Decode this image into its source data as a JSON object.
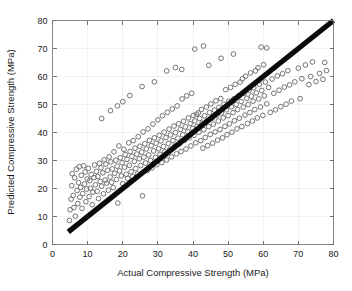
{
  "chart_data": {
    "type": "scatter",
    "title": "",
    "xlabel": "Actual Compressive Strength (MPa)",
    "ylabel": "Predicted Compressive Strength (MPa)",
    "xlim": [
      0,
      80
    ],
    "ylim": [
      0,
      80
    ],
    "xticks": [
      0,
      10,
      20,
      30,
      40,
      50,
      60,
      70,
      80
    ],
    "yticks": [
      0,
      10,
      20,
      30,
      40,
      50,
      60,
      70,
      80
    ],
    "xtick_labels": [
      "0",
      "10",
      "20",
      "30",
      "40",
      "50",
      "60",
      "70",
      "80"
    ],
    "ytick_labels": [
      "0",
      "10",
      "20",
      "30",
      "40",
      "50",
      "60",
      "70",
      "80"
    ],
    "grid": true,
    "legend": "none",
    "marker": "open-circle",
    "marker_color": "#6b6b6b",
    "reference_line": {
      "name": "identity-line",
      "type": "line",
      "x": [
        4.5,
        80
      ],
      "y": [
        4.5,
        80
      ],
      "color": "#0b0b0b",
      "width": 5.2
    },
    "series": [
      {
        "name": "Predicted vs Actual",
        "points": [
          [
            4.8,
            8.6
          ],
          [
            5.0,
            12.4
          ],
          [
            5.3,
            16.2
          ],
          [
            5.5,
            21.0
          ],
          [
            5.6,
            25.3
          ],
          [
            5.9,
            17.5
          ],
          [
            6.1,
            13.2
          ],
          [
            6.3,
            23.8
          ],
          [
            6.5,
            10.1
          ],
          [
            6.8,
            26.9
          ],
          [
            7.0,
            19.3
          ],
          [
            7.2,
            14.6
          ],
          [
            7.4,
            22.1
          ],
          [
            7.6,
            27.8
          ],
          [
            7.8,
            16.9
          ],
          [
            8.0,
            20.4
          ],
          [
            8.2,
            24.7
          ],
          [
            8.4,
            12.9
          ],
          [
            8.6,
            18.2
          ],
          [
            8.9,
            28.1
          ],
          [
            9.1,
            21.6
          ],
          [
            9.3,
            25.9
          ],
          [
            9.5,
            15.3
          ],
          [
            9.7,
            19.8
          ],
          [
            9.9,
            23.4
          ],
          [
            10.2,
            27.2
          ],
          [
            10.4,
            17.1
          ],
          [
            10.6,
            22.8
          ],
          [
            10.8,
            20.1
          ],
          [
            11.0,
            25.0
          ],
          [
            11.3,
            14.2
          ],
          [
            11.5,
            18.7
          ],
          [
            11.8,
            23.9
          ],
          [
            12.0,
            28.4
          ],
          [
            12.2,
            21.3
          ],
          [
            12.5,
            26.1
          ],
          [
            12.7,
            19.0
          ],
          [
            12.9,
            24.3
          ],
          [
            13.1,
            16.4
          ],
          [
            13.4,
            29.0
          ],
          [
            13.6,
            22.5
          ],
          [
            13.8,
            27.4
          ],
          [
            14.0,
            20.8
          ],
          [
            14.3,
            25.6
          ],
          [
            14.5,
            18.1
          ],
          [
            14.7,
            30.2
          ],
          [
            15.0,
            23.0
          ],
          [
            15.2,
            28.7
          ],
          [
            15.4,
            21.9
          ],
          [
            15.7,
            26.5
          ],
          [
            15.9,
            19.4
          ],
          [
            16.1,
            31.3
          ],
          [
            16.4,
            24.1
          ],
          [
            16.6,
            29.5
          ],
          [
            16.8,
            22.2
          ],
          [
            17.0,
            27.0
          ],
          [
            17.3,
            20.3
          ],
          [
            17.5,
            33.1
          ],
          [
            17.7,
            25.4
          ],
          [
            18.0,
            30.1
          ],
          [
            18.2,
            23.2
          ],
          [
            18.4,
            28.0
          ],
          [
            18.6,
            14.8
          ],
          [
            18.9,
            35.2
          ],
          [
            19.1,
            26.3
          ],
          [
            19.3,
            31.0
          ],
          [
            19.6,
            24.5
          ],
          [
            19.8,
            29.2
          ],
          [
            20.0,
            21.7
          ],
          [
            20.3,
            34.0
          ],
          [
            20.5,
            27.6
          ],
          [
            20.7,
            32.1
          ],
          [
            21.0,
            25.1
          ],
          [
            21.2,
            30.4
          ],
          [
            21.4,
            23.6
          ],
          [
            21.7,
            36.3
          ],
          [
            21.9,
            28.3
          ],
          [
            22.1,
            33.2
          ],
          [
            22.4,
            26.0
          ],
          [
            22.6,
            31.5
          ],
          [
            22.8,
            24.2
          ],
          [
            23.0,
            37.1
          ],
          [
            23.3,
            29.7
          ],
          [
            23.5,
            34.4
          ],
          [
            23.7,
            27.1
          ],
          [
            24.0,
            32.3
          ],
          [
            24.2,
            25.2
          ],
          [
            24.4,
            38.5
          ],
          [
            24.7,
            30.6
          ],
          [
            24.9,
            35.1
          ],
          [
            25.1,
            28.2
          ],
          [
            25.4,
            33.0
          ],
          [
            25.6,
            17.4
          ],
          [
            25.8,
            40.2
          ],
          [
            26.0,
            31.2
          ],
          [
            26.3,
            36.0
          ],
          [
            26.5,
            29.1
          ],
          [
            26.7,
            34.1
          ],
          [
            27.0,
            26.4
          ],
          [
            27.2,
            41.3
          ],
          [
            27.4,
            32.0
          ],
          [
            27.6,
            37.2
          ],
          [
            27.9,
            30.0
          ],
          [
            28.1,
            35.3
          ],
          [
            28.3,
            27.3
          ],
          [
            28.6,
            43.0
          ],
          [
            28.8,
            33.4
          ],
          [
            29.0,
            38.1
          ],
          [
            29.3,
            31.1
          ],
          [
            29.5,
            36.2
          ],
          [
            29.7,
            28.5
          ],
          [
            30.0,
            44.5
          ],
          [
            30.2,
            34.2
          ],
          [
            30.4,
            39.0
          ],
          [
            30.6,
            32.2
          ],
          [
            30.9,
            37.0
          ],
          [
            31.1,
            29.3
          ],
          [
            31.3,
            46.0
          ],
          [
            31.6,
            35.0
          ],
          [
            31.8,
            40.1
          ],
          [
            32.0,
            33.1
          ],
          [
            32.3,
            38.2
          ],
          [
            32.5,
            30.2
          ],
          [
            32.7,
            47.2
          ],
          [
            33.0,
            36.1
          ],
          [
            33.2,
            41.2
          ],
          [
            33.4,
            34.0
          ],
          [
            33.6,
            39.1
          ],
          [
            33.9,
            31.3
          ],
          [
            34.1,
            48.4
          ],
          [
            34.3,
            37.1
          ],
          [
            34.6,
            42.3
          ],
          [
            34.8,
            35.1
          ],
          [
            35.0,
            40.0
          ],
          [
            35.3,
            32.4
          ],
          [
            35.5,
            49.5
          ],
          [
            35.7,
            38.0
          ],
          [
            35.9,
            43.1
          ],
          [
            36.2,
            36.0
          ],
          [
            36.4,
            41.1
          ],
          [
            36.6,
            33.2
          ],
          [
            36.9,
            52.0
          ],
          [
            37.1,
            39.2
          ],
          [
            37.3,
            44.0
          ],
          [
            37.6,
            37.2
          ],
          [
            37.8,
            42.0
          ],
          [
            38.0,
            34.1
          ],
          [
            38.2,
            53.1
          ],
          [
            38.5,
            40.3
          ],
          [
            38.7,
            45.2
          ],
          [
            38.9,
            38.1
          ],
          [
            39.2,
            43.2
          ],
          [
            39.4,
            35.2
          ],
          [
            39.6,
            54.0
          ],
          [
            39.9,
            41.4
          ],
          [
            40.1,
            46.1
          ],
          [
            40.3,
            39.0
          ],
          [
            40.5,
            44.1
          ],
          [
            40.8,
            36.3
          ],
          [
            41.0,
            46.5
          ],
          [
            41.2,
            42.2
          ],
          [
            41.5,
            47.0
          ],
          [
            41.7,
            40.1
          ],
          [
            41.9,
            45.0
          ],
          [
            42.2,
            37.1
          ],
          [
            42.4,
            48.2
          ],
          [
            42.6,
            43.3
          ],
          [
            42.8,
            34.4
          ],
          [
            43.1,
            41.0
          ],
          [
            43.3,
            46.0
          ],
          [
            43.5,
            38.2
          ],
          [
            43.8,
            49.1
          ],
          [
            44.0,
            44.2
          ],
          [
            44.2,
            35.3
          ],
          [
            44.5,
            42.1
          ],
          [
            44.7,
            47.1
          ],
          [
            44.9,
            39.3
          ],
          [
            45.1,
            50.2
          ],
          [
            45.4,
            45.1
          ],
          [
            45.6,
            36.2
          ],
          [
            45.8,
            43.0
          ],
          [
            46.1,
            48.0
          ],
          [
            46.3,
            40.2
          ],
          [
            46.5,
            51.3
          ],
          [
            46.8,
            46.2
          ],
          [
            47.0,
            37.3
          ],
          [
            47.2,
            44.1
          ],
          [
            47.4,
            49.0
          ],
          [
            47.7,
            41.1
          ],
          [
            47.9,
            52.1
          ],
          [
            48.1,
            47.0
          ],
          [
            48.4,
            38.1
          ],
          [
            48.6,
            45.2
          ],
          [
            48.8,
            50.1
          ],
          [
            49.1,
            42.2
          ],
          [
            49.3,
            55.3
          ],
          [
            49.5,
            48.1
          ],
          [
            49.7,
            39.2
          ],
          [
            50.0,
            46.0
          ],
          [
            50.2,
            51.2
          ],
          [
            50.4,
            43.1
          ],
          [
            50.7,
            56.1
          ],
          [
            50.9,
            49.2
          ],
          [
            51.1,
            40.1
          ],
          [
            51.4,
            47.1
          ],
          [
            51.6,
            52.0
          ],
          [
            51.8,
            44.2
          ],
          [
            52.0,
            57.2
          ],
          [
            52.3,
            50.0
          ],
          [
            52.5,
            41.3
          ],
          [
            52.7,
            48.2
          ],
          [
            53.0,
            53.1
          ],
          [
            53.2,
            45.1
          ],
          [
            53.4,
            58.0
          ],
          [
            53.7,
            51.1
          ],
          [
            53.9,
            42.1
          ],
          [
            54.1,
            59.2
          ],
          [
            54.3,
            49.1
          ],
          [
            54.6,
            54.0
          ],
          [
            54.8,
            46.2
          ],
          [
            55.0,
            60.1
          ],
          [
            55.3,
            52.2
          ],
          [
            55.5,
            43.2
          ],
          [
            55.7,
            50.0
          ],
          [
            56.0,
            55.1
          ],
          [
            56.2,
            47.1
          ],
          [
            56.4,
            61.3
          ],
          [
            56.6,
            53.0
          ],
          [
            56.9,
            44.1
          ],
          [
            57.1,
            51.2
          ],
          [
            57.3,
            56.0
          ],
          [
            57.6,
            48.2
          ],
          [
            57.8,
            62.0
          ],
          [
            58.0,
            54.1
          ],
          [
            58.3,
            45.2
          ],
          [
            58.5,
            63.1
          ],
          [
            58.7,
            52.0
          ],
          [
            58.9,
            57.2
          ],
          [
            59.2,
            49.1
          ],
          [
            59.4,
            70.5
          ],
          [
            59.6,
            55.0
          ],
          [
            59.9,
            46.1
          ],
          [
            60.1,
            64.2
          ],
          [
            60.3,
            53.1
          ],
          [
            60.6,
            58.0
          ],
          [
            61.0,
            50.2
          ],
          [
            61.5,
            56.1
          ],
          [
            62.0,
            47.2
          ],
          [
            62.5,
            59.1
          ],
          [
            63.0,
            54.0
          ],
          [
            63.5,
            48.1
          ],
          [
            64.0,
            60.2
          ],
          [
            64.5,
            55.1
          ],
          [
            65.0,
            49.2
          ],
          [
            65.5,
            61.0
          ],
          [
            66.0,
            56.2
          ],
          [
            66.5,
            50.1
          ],
          [
            67.0,
            62.1
          ],
          [
            67.5,
            57.0
          ],
          [
            68.0,
            51.2
          ],
          [
            69.0,
            58.1
          ],
          [
            70.0,
            63.0
          ],
          [
            70.5,
            52.1
          ],
          [
            71.0,
            59.2
          ],
          [
            72.0,
            64.1
          ],
          [
            73.0,
            57.1
          ],
          [
            73.5,
            60.0
          ],
          [
            74.0,
            65.2
          ],
          [
            75.0,
            58.2
          ],
          [
            76.0,
            61.1
          ],
          [
            77.0,
            59.0
          ],
          [
            77.5,
            65.0
          ],
          [
            78.0,
            62.1
          ],
          [
            40.5,
            69.8
          ],
          [
            43.0,
            70.9
          ],
          [
            32.5,
            62.0
          ],
          [
            35.0,
            63.2
          ],
          [
            36.8,
            62.5
          ],
          [
            29.0,
            58.1
          ],
          [
            25.5,
            56.4
          ],
          [
            22.0,
            53.2
          ],
          [
            20.0,
            51.0
          ],
          [
            18.5,
            49.5
          ],
          [
            16.5,
            47.8
          ],
          [
            14.0,
            45.0
          ],
          [
            51.5,
            68.0
          ],
          [
            48.0,
            66.5
          ],
          [
            44.5,
            64.0
          ],
          [
            61.0,
            70.2
          ]
        ]
      }
    ]
  }
}
